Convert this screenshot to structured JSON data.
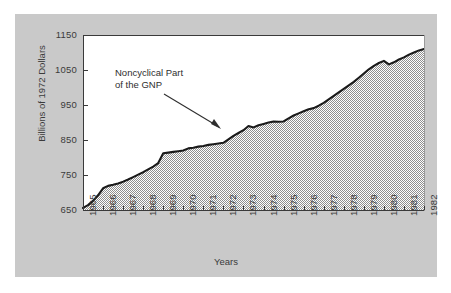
{
  "figure": {
    "background_color": "#c9c9c9",
    "plot_background_color": "#ffffff",
    "area_fill_color": "#b0b0b0",
    "line_color": "#1a1a1a",
    "axis_color": "#3a3a3a"
  },
  "annotation": {
    "line1": "Noncyclical Part",
    "line2": "of the GNP"
  },
  "chart_data": {
    "type": "area",
    "title": "",
    "xlabel": "Years",
    "ylabel": "Billions of 1972 Dollars",
    "xlim": [
      1965,
      1982
    ],
    "ylim": [
      650,
      1150
    ],
    "yticks": [
      650,
      750,
      850,
      950,
      1050,
      1150
    ],
    "xticks": [
      1965,
      1966,
      1967,
      1968,
      1969,
      1970,
      1971,
      1972,
      1973,
      1974,
      1975,
      1976,
      1977,
      1978,
      1979,
      1980,
      1981,
      1982
    ],
    "grid": false,
    "legend": null,
    "series": [
      {
        "name": "Noncyclical Part of the GNP",
        "x": [
          1965.0,
          1965.25,
          1965.5,
          1965.75,
          1966.0,
          1966.25,
          1966.5,
          1966.75,
          1967.0,
          1967.25,
          1967.5,
          1967.75,
          1968.0,
          1968.25,
          1968.5,
          1968.75,
          1969.0,
          1969.25,
          1969.5,
          1969.75,
          1970.0,
          1970.25,
          1970.5,
          1970.75,
          1971.0,
          1971.25,
          1971.5,
          1971.75,
          1972.0,
          1972.25,
          1972.5,
          1972.75,
          1973.0,
          1973.25,
          1973.5,
          1973.75,
          1974.0,
          1974.25,
          1974.5,
          1974.75,
          1975.0,
          1975.25,
          1975.5,
          1975.75,
          1976.0,
          1976.25,
          1976.5,
          1976.75,
          1977.0,
          1977.25,
          1977.5,
          1977.75,
          1978.0,
          1978.25,
          1978.5,
          1978.75,
          1979.0,
          1979.25,
          1979.5,
          1979.75,
          1980.0,
          1980.25,
          1980.5,
          1980.75,
          1981.0,
          1981.25,
          1981.5,
          1981.75,
          1982.0
        ],
        "y": [
          656,
          664,
          676,
          692,
          712,
          719,
          722,
          726,
          731,
          737,
          744,
          751,
          758,
          766,
          774,
          784,
          812,
          814,
          816,
          818,
          820,
          826,
          828,
          831,
          833,
          836,
          838,
          840,
          842,
          852,
          862,
          870,
          878,
          890,
          886,
          892,
          896,
          900,
          903,
          902,
          903,
          912,
          920,
          926,
          932,
          938,
          941,
          948,
          956,
          966,
          976,
          986,
          996,
          1006,
          1016,
          1028,
          1040,
          1052,
          1062,
          1070,
          1076,
          1066,
          1072,
          1080,
          1086,
          1094,
          1100,
          1106,
          1110
        ]
      }
    ]
  }
}
